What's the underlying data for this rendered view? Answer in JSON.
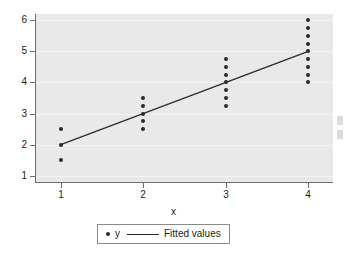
{
  "chart_data": {
    "type": "scatter",
    "title": "",
    "subtitle": "",
    "xlabel": "x",
    "ylabel": "",
    "xlim": [
      0.7,
      4.3
    ],
    "ylim": [
      0.8,
      6.2
    ],
    "xticks": [
      1,
      2,
      3,
      4
    ],
    "xtick_labels": [
      "1",
      "2",
      "3",
      "4"
    ],
    "yticks": [
      1,
      2,
      3,
      4,
      5,
      6
    ],
    "ytick_labels": [
      "1",
      "2",
      "3",
      "4",
      "5",
      "6"
    ],
    "grid": true,
    "grid_axis": "y",
    "legend_position": "below",
    "series": [
      {
        "name": "y",
        "type": "scatter",
        "marker": "filled-circle",
        "color": "#2a2a2a",
        "points": [
          {
            "x": 1,
            "y": 2.5
          },
          {
            "x": 1,
            "y": 2.0
          },
          {
            "x": 1,
            "y": 1.5
          },
          {
            "x": 2,
            "y": 3.5
          },
          {
            "x": 2,
            "y": 3.25
          },
          {
            "x": 2,
            "y": 3.0
          },
          {
            "x": 2,
            "y": 2.75
          },
          {
            "x": 2,
            "y": 2.5
          },
          {
            "x": 3,
            "y": 4.75
          },
          {
            "x": 3,
            "y": 4.5
          },
          {
            "x": 3,
            "y": 4.25
          },
          {
            "x": 3,
            "y": 4.0
          },
          {
            "x": 3,
            "y": 3.75
          },
          {
            "x": 3,
            "y": 3.5
          },
          {
            "x": 3,
            "y": 3.25
          },
          {
            "x": 4,
            "y": 6.0
          },
          {
            "x": 4,
            "y": 5.75
          },
          {
            "x": 4,
            "y": 5.5
          },
          {
            "x": 4,
            "y": 5.25
          },
          {
            "x": 4,
            "y": 5.0
          },
          {
            "x": 4,
            "y": 4.75
          },
          {
            "x": 4,
            "y": 4.5
          },
          {
            "x": 4,
            "y": 4.25
          },
          {
            "x": 4,
            "y": 4.0
          }
        ]
      },
      {
        "name": "Fitted values",
        "type": "line",
        "color": "#2a2a2a",
        "endpoints": [
          {
            "x": 1,
            "y": 2.0
          },
          {
            "x": 4,
            "y": 5.0
          }
        ],
        "slope": 1.0,
        "intercept": 1.0
      }
    ]
  },
  "legend": {
    "marker_label": "y",
    "line_label": "Fitted values"
  },
  "axis": {
    "x_title": "x"
  },
  "colors": {
    "plot_background": "#e9e9e9",
    "page_background": "#ffffff",
    "gridline": "#f3f3f3",
    "axis": "#6d6d6d",
    "marker": "#2a2a2a",
    "fit_line": "#2a2a2a",
    "text": "#1c1c1c"
  }
}
